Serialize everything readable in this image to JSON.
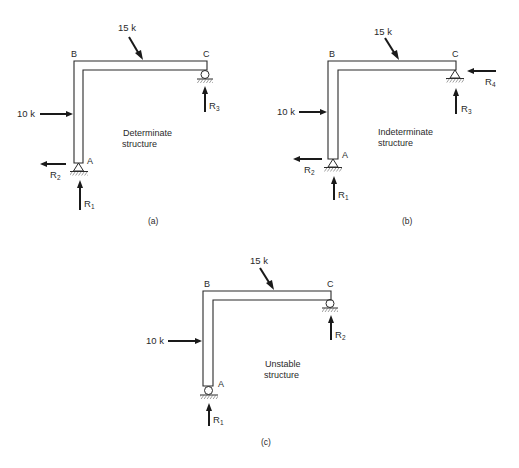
{
  "figure": {
    "colors": {
      "ink": "#2a2a2a",
      "background": "#ffffff"
    },
    "panels": [
      {
        "id": "a",
        "caption": "(a)",
        "description_line1": "Determinate",
        "description_line2": "structure",
        "nodes": {
          "A": "A",
          "B": "B",
          "C": "C"
        },
        "supports": {
          "A": "pin",
          "C": "roller"
        },
        "loads": [
          {
            "label": "15 k",
            "direction": "inclined-down-right",
            "location": "beam BC"
          },
          {
            "label": "10 k",
            "direction": "horizontal-right",
            "location": "column AB"
          }
        ],
        "reactions": [
          {
            "label": "R",
            "sub": "1",
            "direction": "up",
            "at": "A"
          },
          {
            "label": "R",
            "sub": "2",
            "direction": "left",
            "at": "A"
          },
          {
            "label": "R",
            "sub": "3",
            "direction": "up",
            "at": "C"
          }
        ]
      },
      {
        "id": "b",
        "caption": "(b)",
        "description_line1": "Indeterminate",
        "description_line2": "structure",
        "nodes": {
          "A": "A",
          "B": "B",
          "C": "C"
        },
        "supports": {
          "A": "pin",
          "C": "pin"
        },
        "loads": [
          {
            "label": "15 k",
            "direction": "inclined-down-right",
            "location": "beam BC"
          },
          {
            "label": "10 k",
            "direction": "horizontal-right",
            "location": "column AB"
          }
        ],
        "reactions": [
          {
            "label": "R",
            "sub": "1",
            "direction": "up",
            "at": "A"
          },
          {
            "label": "R",
            "sub": "2",
            "direction": "left",
            "at": "A"
          },
          {
            "label": "R",
            "sub": "3",
            "direction": "up",
            "at": "C"
          },
          {
            "label": "R",
            "sub": "4",
            "direction": "left",
            "at": "C"
          }
        ]
      },
      {
        "id": "c",
        "caption": "(c)",
        "description_line1": "Unstable",
        "description_line2": "structure",
        "nodes": {
          "A": "A",
          "B": "B",
          "C": "C"
        },
        "supports": {
          "A": "roller",
          "C": "roller"
        },
        "loads": [
          {
            "label": "15 k",
            "direction": "inclined-down-right",
            "location": "beam BC"
          },
          {
            "label": "10 k",
            "direction": "horizontal-right",
            "location": "column AB"
          }
        ],
        "reactions": [
          {
            "label": "R",
            "sub": "1",
            "direction": "up",
            "at": "A"
          },
          {
            "label": "R",
            "sub": "2",
            "direction": "up",
            "at": "C"
          }
        ]
      }
    ]
  }
}
